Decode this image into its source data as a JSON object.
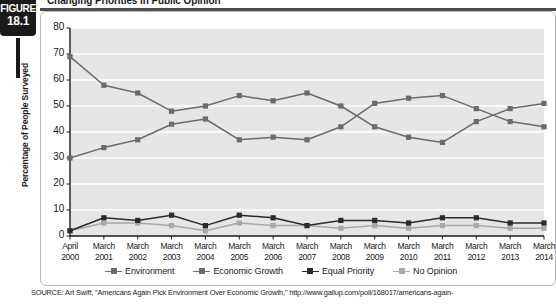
{
  "figure": {
    "badge_word": "FIGURE",
    "badge_number": "18.1",
    "title": "Changing Priorities in Public Opinion"
  },
  "source": {
    "text": "SOURCE: Art Swift, \"Americans Again Pick Environment Over Economic Growth,\" http://www.gallup.com/poll/168017/americans-again-"
  },
  "colors": {
    "plot_background": "#e6e6e6",
    "gridline": "#ffffff",
    "axis": "#1a1a1a",
    "environment": "#6b6b6b",
    "economic_growth": "#6b6b6b",
    "equal_priority": "#2b2b2b",
    "no_opinion": "#a8a8a8",
    "badge": "#1a1a1a",
    "card_border": "#b8b8b8"
  },
  "chart_data": {
    "type": "line",
    "title": "Changing Priorities in Public Opinion",
    "xlabel": "",
    "ylabel": "Percentage of People Surveyed",
    "ylim": [
      0,
      80
    ],
    "ytick_step": 10,
    "yticks": [
      "0",
      "10",
      "20",
      "30",
      "40",
      "50",
      "60",
      "70",
      "80"
    ],
    "grid": true,
    "legend_position": "bottom",
    "categories": [
      "April\n2000",
      "March\n2001",
      "March\n2002",
      "March\n2003",
      "March\n2004",
      "March\n2005",
      "March\n2006",
      "March\n2007",
      "March\n2008",
      "March\n2009",
      "March\n2010",
      "March\n2011",
      "March\n2012",
      "March\n2013",
      "March\n2014"
    ],
    "category_months": [
      "April",
      "March",
      "March",
      "March",
      "March",
      "March",
      "March",
      "March",
      "March",
      "March",
      "March",
      "March",
      "March",
      "March",
      "March"
    ],
    "category_years": [
      "2000",
      "2001",
      "2002",
      "2003",
      "2004",
      "2005",
      "2006",
      "2007",
      "2008",
      "2009",
      "2010",
      "2011",
      "2012",
      "2013",
      "2014"
    ],
    "series": [
      {
        "name": "Environment",
        "color": "#6b6b6b",
        "values": [
          69,
          58,
          55,
          48,
          50,
          54,
          52,
          55,
          50,
          42,
          38,
          36,
          44,
          49,
          51
        ]
      },
      {
        "name": "Economic Growth",
        "color": "#6b6b6b",
        "values": [
          30,
          34,
          37,
          43,
          45,
          37,
          38,
          37,
          42,
          51,
          53,
          54,
          49,
          44,
          42
        ]
      },
      {
        "name": "Equal Priority",
        "color": "#2b2b2b",
        "values": [
          2,
          7,
          6,
          8,
          4,
          8,
          7,
          4,
          6,
          6,
          5,
          7,
          7,
          5,
          5
        ]
      },
      {
        "name": "No Opinion",
        "color": "#a8a8a8",
        "values": [
          2,
          5,
          5,
          4,
          2,
          5,
          4,
          4,
          3,
          4,
          3,
          4,
          4,
          3,
          3
        ]
      }
    ]
  }
}
